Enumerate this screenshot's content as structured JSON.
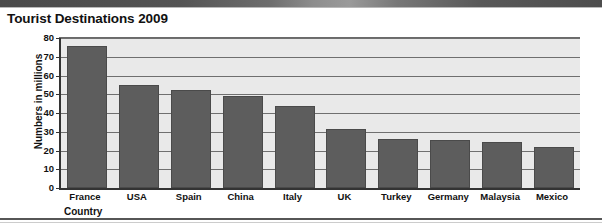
{
  "page": {
    "title": "Tourist Destinations 2009",
    "background_color": "#ffffff"
  },
  "chart_data": {
    "type": "bar",
    "title": "Tourist Destinations 2009",
    "xlabel": "Country",
    "ylabel": "Numbers in millions",
    "categories": [
      "France",
      "USA",
      "Spain",
      "China",
      "Italy",
      "UK",
      "Turkey",
      "Germany",
      "Malaysia",
      "Mexico"
    ],
    "values": [
      76,
      55,
      52.5,
      49,
      44,
      31.5,
      26,
      25.5,
      24.5,
      22
    ],
    "ylim": [
      0,
      80
    ],
    "ytick_step": 10,
    "ytick_labels": [
      "0",
      "10",
      "20",
      "30",
      "40",
      "50",
      "60",
      "70",
      "80"
    ],
    "grid": true,
    "legend": "none",
    "bar_color": "#5d5d5d",
    "plot_background_color": "#e9e9e9",
    "gridline_color": "#6f6f6f",
    "axis_color": "#333333"
  }
}
